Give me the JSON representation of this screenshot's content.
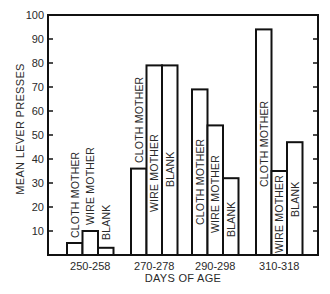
{
  "chart_data": {
    "type": "bar",
    "title": "",
    "xlabel": "DAYS OF AGE",
    "ylabel": "MEAN LEVER PRESSES",
    "ylim": [
      0,
      100
    ],
    "yticks": [
      10,
      20,
      30,
      40,
      50,
      60,
      70,
      80,
      90,
      100
    ],
    "grid": false,
    "legend": "none (bars labeled directly with rotated text)",
    "categories": [
      "250-258",
      "270-278",
      "290-298",
      "310-318"
    ],
    "series": [
      {
        "name": "CLOTH MOTHER",
        "values": [
          5,
          36,
          69,
          94
        ]
      },
      {
        "name": "WIRE MOTHER",
        "values": [
          10,
          79,
          54,
          35
        ]
      },
      {
        "name": "BLANK",
        "values": [
          3,
          79,
          32,
          47
        ]
      }
    ]
  },
  "bar_labels": {
    "cloth": "CLOTH MOTHER",
    "wire": "WIRE MOTHER",
    "blank": "BLANK"
  },
  "colors": {
    "stroke": "#111111",
    "fill": "#ffffff",
    "text": "#2a2a2a"
  }
}
